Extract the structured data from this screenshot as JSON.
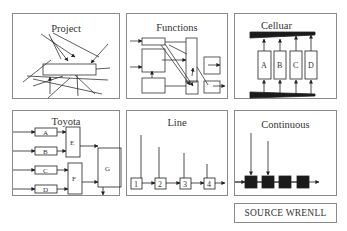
{
  "panels": [
    {
      "id": "project",
      "title": "Project"
    },
    {
      "id": "functions",
      "title": "Functions"
    },
    {
      "id": "cellular",
      "title": "Celluar",
      "cells": [
        "A",
        "B",
        "C",
        "D"
      ]
    },
    {
      "id": "toyota",
      "title": "Toyota",
      "inputs": [
        "A",
        "B",
        "C",
        "D"
      ],
      "merges": [
        "E",
        "F"
      ],
      "final": "G"
    },
    {
      "id": "line",
      "title": "Line",
      "stations": [
        "1",
        "2",
        "3",
        "4"
      ]
    },
    {
      "id": "continuous",
      "title": "Continuous"
    }
  ],
  "source": {
    "label": "SOURCE WRENLL"
  },
  "colors": {
    "line": "#333333",
    "border": "#8a8a8a",
    "fill_dark": "#1a1a1a"
  }
}
